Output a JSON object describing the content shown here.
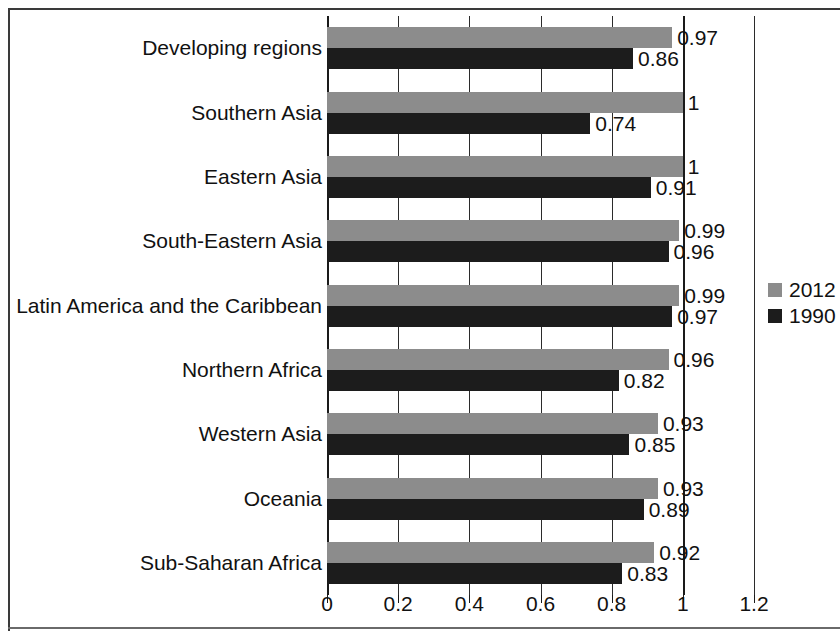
{
  "chart_data": {
    "type": "bar",
    "orientation": "horizontal",
    "title": "",
    "subtitle": "",
    "xlabel": "",
    "ylabel": "",
    "xlim": [
      0,
      1.2
    ],
    "xticks": [
      "0",
      "0.2",
      "0.4",
      "0.6",
      "0.8",
      "1",
      "1.2"
    ],
    "xtick_values": [
      0,
      0.2,
      0.4,
      0.6,
      0.8,
      1,
      1.2
    ],
    "grid": true,
    "grid_axis": "x",
    "legend_position": "right",
    "categories": [
      "Developing regions",
      "Southern Asia",
      "Eastern Asia",
      "South-Eastern Asia",
      "Latin America and the Caribbean",
      "Northern Africa",
      "Western Asia",
      "Oceania",
      "Sub-Saharan Africa"
    ],
    "series": [
      {
        "name": "2012",
        "color": "#8c8c8c",
        "values": [
          0.97,
          1,
          1,
          0.99,
          0.99,
          0.96,
          0.93,
          0.93,
          0.92
        ],
        "labels": [
          "0.97",
          "1",
          "1",
          "0.99",
          "0.99",
          "0.96",
          "0.93",
          "0.93",
          "0.92"
        ]
      },
      {
        "name": "1990",
        "color": "#1c1c1c",
        "values": [
          0.86,
          0.74,
          0.91,
          0.96,
          0.97,
          0.82,
          0.85,
          0.89,
          0.83
        ],
        "labels": [
          "0.86",
          "0.74",
          "0.91",
          "0.96",
          "0.97",
          "0.82",
          "0.85",
          "0.89",
          "0.83"
        ]
      }
    ]
  },
  "legend": {
    "items": [
      {
        "label": "2012",
        "color": "#8c8c8c"
      },
      {
        "label": "1990",
        "color": "#1c1c1c"
      }
    ]
  },
  "colors": {
    "series_2012": "#8c8c8c",
    "series_1990": "#1c1c1c",
    "axis": "#1a1a1a",
    "grid": "#2b2b2b",
    "text": "#111111",
    "background": "#ffffff"
  }
}
